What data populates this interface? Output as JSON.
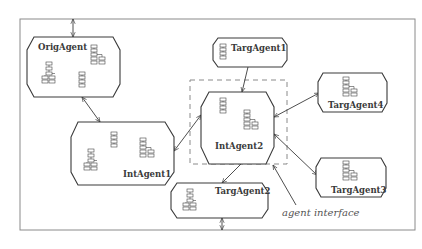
{
  "diagram": {
    "type": "agent-architecture",
    "colors": {
      "stroke": "#3a3a3a",
      "frame": "#8a8a8a",
      "background": "#ffffff"
    },
    "agents": {
      "orig": {
        "label": "OrigAgent"
      },
      "int1": {
        "label": "IntAgent1"
      },
      "int2": {
        "label": "IntAgent2"
      },
      "targ1": {
        "label": "TargAgent1"
      },
      "targ2": {
        "label": "TargAgent2"
      },
      "targ3": {
        "label": "TargAgent3"
      },
      "targ4": {
        "label": "TargAgent4"
      }
    },
    "annotation": {
      "label": "agent interface"
    },
    "connections": [
      {
        "from": "external-top",
        "to": "OrigAgent",
        "type": "bidirectional"
      },
      {
        "from": "OrigAgent",
        "to": "IntAgent1",
        "type": "bidirectional"
      },
      {
        "from": "IntAgent1",
        "to": "IntAgent2",
        "type": "bidirectional"
      },
      {
        "from": "TargAgent1",
        "to": "IntAgent2",
        "type": "directed"
      },
      {
        "from": "IntAgent2",
        "to": "TargAgent4",
        "type": "bidirectional"
      },
      {
        "from": "IntAgent2",
        "to": "TargAgent3",
        "type": "bidirectional"
      },
      {
        "from": "IntAgent2",
        "to": "TargAgent2",
        "type": "directed"
      },
      {
        "from": "TargAgent2",
        "to": "external-bottom",
        "type": "bidirectional"
      }
    ]
  }
}
